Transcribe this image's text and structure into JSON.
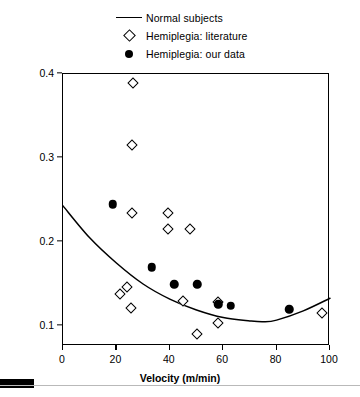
{
  "chart_data": {
    "type": "scatter",
    "title": "",
    "xlabel": "Velocity (m/min)",
    "ylabel": "Net oxygen cost (ml/kg · m)",
    "xlim": [
      0,
      100
    ],
    "ylim": [
      0.085,
      0.4
    ],
    "xticks": [
      0,
      20,
      40,
      60,
      80,
      100
    ],
    "yticks": [
      0.1,
      0.2,
      0.3,
      0.4
    ],
    "xtick_labels": [
      "0",
      "20",
      "40",
      "60",
      "80",
      "100"
    ],
    "ytick_labels": [
      "0.1",
      "0.2",
      "0.3",
      "0.4"
    ],
    "grid": false,
    "legend_position": "top-center",
    "series": [
      {
        "name": "Normal subjects",
        "marker": "line",
        "type": "line",
        "points": [
          {
            "x": 0,
            "y": 0.243
          },
          {
            "x": 10,
            "y": 0.205
          },
          {
            "x": 20,
            "y": 0.175
          },
          {
            "x": 30,
            "y": 0.15
          },
          {
            "x": 40,
            "y": 0.132
          },
          {
            "x": 50,
            "y": 0.119
          },
          {
            "x": 60,
            "y": 0.11
          },
          {
            "x": 70,
            "y": 0.106
          },
          {
            "x": 75,
            "y": 0.105
          },
          {
            "x": 80,
            "y": 0.107
          },
          {
            "x": 90,
            "y": 0.118
          },
          {
            "x": 100,
            "y": 0.133
          }
        ]
      },
      {
        "name": "Hemiplegia: literature",
        "marker": "open-diamond",
        "type": "scatter",
        "points": [
          {
            "x": 26.2,
            "y": 0.389
          },
          {
            "x": 25.9,
            "y": 0.316
          },
          {
            "x": 25.9,
            "y": 0.234
          },
          {
            "x": 39.3,
            "y": 0.234
          },
          {
            "x": 39.3,
            "y": 0.216
          },
          {
            "x": 47.6,
            "y": 0.216
          },
          {
            "x": 24.0,
            "y": 0.146
          },
          {
            "x": 21.4,
            "y": 0.138
          },
          {
            "x": 25.5,
            "y": 0.122
          },
          {
            "x": 45.0,
            "y": 0.13
          },
          {
            "x": 58.1,
            "y": 0.129
          },
          {
            "x": 58.1,
            "y": 0.103
          },
          {
            "x": 50.2,
            "y": 0.09
          },
          {
            "x": 97.0,
            "y": 0.115
          }
        ]
      },
      {
        "name": "Hemiplegia: our data",
        "marker": "filled-circle",
        "type": "scatter",
        "points": [
          {
            "x": 18.7,
            "y": 0.245
          },
          {
            "x": 33.3,
            "y": 0.17
          },
          {
            "x": 41.6,
            "y": 0.15
          },
          {
            "x": 50.2,
            "y": 0.15
          },
          {
            "x": 58.1,
            "y": 0.126
          },
          {
            "x": 62.9,
            "y": 0.124
          },
          {
            "x": 84.7,
            "y": 0.12
          }
        ]
      }
    ]
  },
  "legend": {
    "items": [
      {
        "label": "Normal subjects",
        "key": "line-key"
      },
      {
        "label": "Hemiplegia: literature",
        "key": "open-diamond-key"
      },
      {
        "label": "Hemiplegia: our data",
        "key": "filled-circle-key"
      }
    ]
  },
  "colors": {
    "axis": "#000000",
    "curve": "#000000",
    "marker_fill": "#000000",
    "marker_open": "#ffffff",
    "background": "#ffffff"
  }
}
